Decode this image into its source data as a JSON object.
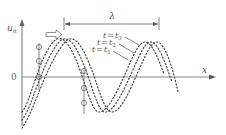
{
  "diagram": {
    "axes": {
      "y_label": "u",
      "y_label_sub": "n",
      "x_label": "x",
      "origin_label": "0"
    },
    "wavelength": {
      "label": "λ"
    },
    "direction_arrow": {
      "meaning": "propagation-direction-right"
    },
    "curves": [
      {
        "id": "t1",
        "label_t": "t",
        "label_eq": "=",
        "label_sub_var": "t",
        "label_sub": "1"
      },
      {
        "id": "t2",
        "label_t": "t",
        "label_eq": "=",
        "label_sub_var": "t",
        "label_sub": "2"
      },
      {
        "id": "t3",
        "label_t": "t",
        "label_eq": "=",
        "label_sub_var": "t",
        "label_sub": "3"
      }
    ],
    "colors": {
      "axis": "#8a8a8a",
      "curve": "#444444",
      "text": "#555555"
    }
  }
}
